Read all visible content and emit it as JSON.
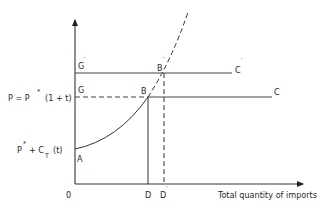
{
  "diagram": {
    "axes": {
      "origin_label": "0",
      "x_axis_label": "Total quantity of imports"
    },
    "price_labels": {
      "tariff_price": "P = P",
      "tariff_price_star": "*",
      "tariff_price_factor": "(1 + t)",
      "base_price": "P",
      "base_price_star": "*",
      "base_price_plus": "+ C",
      "base_price_sub": "T",
      "base_price_t": "(t)"
    },
    "points": {
      "A": "A",
      "B": "B",
      "B_prime": "B",
      "G": "G",
      "G_prime": "G",
      "C": "C",
      "C_prime": "C",
      "D": "D",
      "D_prime": "D",
      "prime_mark": "′"
    }
  }
}
